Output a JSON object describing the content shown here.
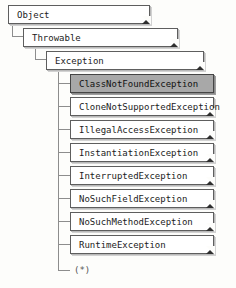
{
  "diagram": {
    "background_color": "#fdfdfb",
    "line_color": "#8d8d8d",
    "box_border_color": "#5e5e5e",
    "box_fill_color": "#ffffff",
    "selected_fill_color": "#a8a8a8",
    "terminator": "(*)"
  },
  "nodes": {
    "object": {
      "label": "Object"
    },
    "throwable": {
      "label": "Throwable"
    },
    "exception": {
      "label": "Exception"
    },
    "class_not_found": {
      "label": "ClassNotFoundException"
    },
    "clone_not_supported": {
      "label": "CloneNotSupportedException"
    },
    "illegal_access": {
      "label": "IllegalAccessException"
    },
    "instantiation": {
      "label": "InstantiationException"
    },
    "interrupted": {
      "label": "InterruptedException"
    },
    "no_such_field": {
      "label": "NoSuchFieldException"
    },
    "no_such_method": {
      "label": "NoSuchMethodException"
    },
    "runtime": {
      "label": "RuntimeException"
    }
  }
}
